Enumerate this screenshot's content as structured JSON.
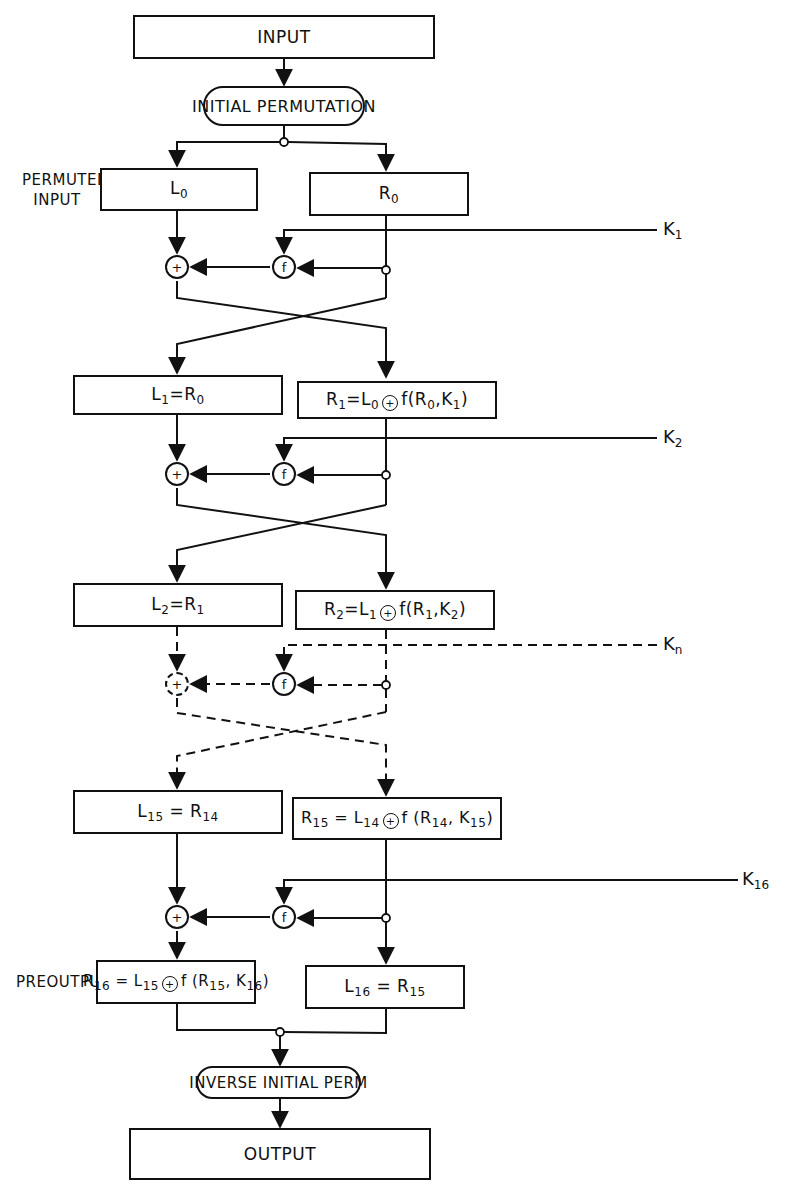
{
  "diagram": {
    "input_label": "INPUT",
    "initial_permutation_label": "INITIAL PERMUTATION",
    "permuted_input_label_line1": "PERMUTED",
    "permuted_input_label_line2": "INPUT",
    "preoutput_label": "PREOUTPUT",
    "inverse_permutation_label": "INVERSE INITIAL PERM",
    "output_label": "OUTPUT",
    "xor_symbol": "+",
    "f_symbol": "f",
    "rounds": [
      {
        "left": {
          "base": "L",
          "sub": "0",
          "rest": ""
        },
        "right": {
          "base": "R",
          "sub": "0",
          "rest": ""
        },
        "key": {
          "base": "K",
          "sub": "1"
        }
      },
      {
        "left": {
          "base": "L",
          "sub": "1",
          "eq": "=R",
          "eqsub": "0"
        },
        "right": {
          "base": "R",
          "sub": "1",
          "eq": "=L",
          "eqsub": "0",
          "fn": "f(R",
          "fnsub1": "0",
          "fnmid": ",K",
          "fnsub2": "1",
          "fnend": ")"
        },
        "key": {
          "base": "K",
          "sub": "2"
        }
      },
      {
        "left": {
          "base": "L",
          "sub": "2",
          "eq": "=R",
          "eqsub": "1"
        },
        "right": {
          "base": "R",
          "sub": "2",
          "eq": "=L",
          "eqsub": "1",
          "fn": "f(R",
          "fnsub1": "1",
          "fnmid": ",K",
          "fnsub2": "2",
          "fnend": ")"
        },
        "key": {
          "base": "K",
          "sub": "n"
        }
      },
      {
        "left": {
          "base": "L",
          "sub": "15",
          "eq": " = R",
          "eqsub": "14"
        },
        "right": {
          "base": "R",
          "sub": "15",
          "eq": " = L",
          "eqsub": "14",
          "fn": "f (R",
          "fnsub1": "14",
          "fnmid": ", K",
          "fnsub2": "15",
          "fnend": ")"
        },
        "key": {
          "base": "K",
          "sub": "16"
        }
      },
      {
        "left": {
          "base": "R",
          "sub": "16",
          "eq": " = L",
          "eqsub": "15",
          "fn": "f (R",
          "fnsub1": "15",
          "fnmid": ", K",
          "fnsub2": "16",
          "fnend": ")"
        },
        "right": {
          "base": "L",
          "sub": "16",
          "eq": " = R",
          "eqsub": "15"
        }
      }
    ]
  }
}
